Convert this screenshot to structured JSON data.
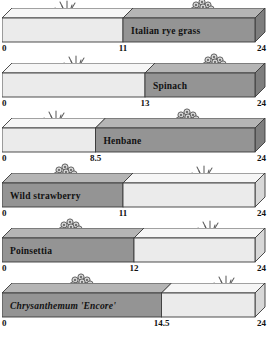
{
  "chart_data": {
    "type": "bar",
    "title": "",
    "subtitle": "",
    "xlabel": "",
    "ylabel": "",
    "xlim": [
      0,
      24
    ],
    "axis_ticks_common": [
      "0",
      "24"
    ],
    "grid": false,
    "legend": "none",
    "orientation": "horizontal",
    "style": "3d-stacked-bar",
    "categories": [
      "Italian rye grass",
      "Spinach",
      "Henbane",
      "Wild strawberry",
      "Poinsettia",
      "Chrysanthemum 'Encore'"
    ],
    "series": [
      {
        "name": "light-segment",
        "values": [
          11,
          13,
          8.5,
          13,
          12,
          9.5
        ]
      },
      {
        "name": "dark-segment",
        "values": [
          13,
          11,
          15.5,
          11,
          12,
          14.5
        ]
      }
    ],
    "bars": [
      {
        "label": "Italian rye grass",
        "label_italic": false,
        "split": 11,
        "split_text": "11",
        "start_text": "0",
        "end_text": "24",
        "dark_side": "right",
        "label_side": "right",
        "left_plant": "grass-plant-icon",
        "right_plant": "flower-plant-icon"
      },
      {
        "label": "Spinach",
        "label_italic": false,
        "split": 13,
        "split_text": "13",
        "start_text": "0",
        "end_text": "24",
        "dark_side": "right",
        "label_side": "right",
        "left_plant": "grass-plant-icon",
        "right_plant": "flower-plant-icon"
      },
      {
        "label": "Henbane",
        "label_italic": false,
        "split": 8.5,
        "split_text": "8.5",
        "start_text": "0",
        "end_text": "24",
        "dark_side": "right",
        "label_side": "right",
        "left_plant": "grass-plant-icon",
        "right_plant": "flower-plant-icon"
      },
      {
        "label": "Wild strawberry",
        "label_italic": false,
        "split": 11,
        "split_text": "11",
        "start_text": "0",
        "end_text": "24",
        "dark_side": "left",
        "label_side": "left",
        "left_plant": "flower-plant-icon",
        "right_plant": "grass-plant-icon"
      },
      {
        "label": "Poinsettia",
        "label_italic": false,
        "split": 12,
        "split_text": "12",
        "start_text": "0",
        "end_text": "24",
        "dark_side": "left",
        "label_side": "left",
        "left_plant": "flower-plant-icon",
        "right_plant": "grass-plant-icon"
      },
      {
        "label": "Chrysanthemum 'Encore'",
        "label_italic": true,
        "split": 14.5,
        "split_text": "14.5",
        "start_text": "0",
        "end_text": "24",
        "dark_side": "left",
        "label_side": "left",
        "left_plant": "flower-plant-icon",
        "right_plant": "grass-plant-icon"
      }
    ],
    "colors": {
      "light_front": "#ebebeb",
      "light_top": "#f6f6f6",
      "dark_front": "#949494",
      "dark_top": "#b5b5b5",
      "outline": "#3a3a3a",
      "text": "#111111",
      "background": "#ffffff"
    }
  }
}
